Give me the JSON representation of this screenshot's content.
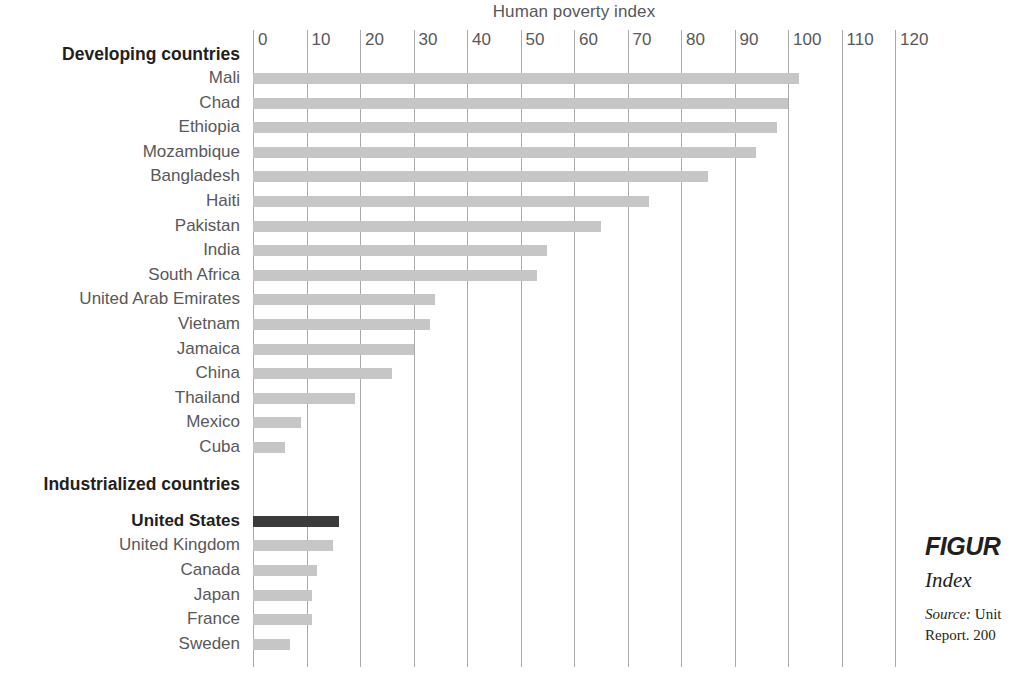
{
  "chart_data": {
    "type": "bar",
    "orientation": "horizontal",
    "title": "Human poverty index",
    "xlabel": "Human poverty index",
    "ylabel": "",
    "xlim": [
      0,
      125
    ],
    "xticks": [
      0,
      10,
      20,
      30,
      40,
      50,
      60,
      70,
      80,
      90,
      100,
      110,
      120
    ],
    "grid": "vertical",
    "legend": "none",
    "groups": [
      {
        "name": "Developing countries",
        "categories": [
          "Mali",
          "Chad",
          "Ethiopia",
          "Mozambique",
          "Bangladesh",
          "Haiti",
          "Pakistan",
          "India",
          "South Africa",
          "United Arab Emirates",
          "Vietnam",
          "Jamaica",
          "China",
          "Thailand",
          "Mexico",
          "Cuba"
        ],
        "values": [
          102,
          100,
          98,
          94,
          85,
          74,
          65,
          55,
          53,
          34,
          33,
          30,
          26,
          19,
          9,
          6
        ]
      },
      {
        "name": "Industrialized countries",
        "categories": [
          "United States",
          "United Kingdom",
          "Canada",
          "Japan",
          "France",
          "Sweden"
        ],
        "values": [
          16,
          15,
          12,
          11,
          11,
          7
        ],
        "highlight": "United States"
      }
    ],
    "colors": {
      "bar": "#c6c6c6",
      "bar_highlight": "#3b3b3b",
      "gridline": "#a7a9ac",
      "text": "#58585a",
      "heading": "#231f20"
    }
  },
  "axis": {
    "title": "Human poverty index",
    "ticks": [
      "0",
      "10",
      "20",
      "30",
      "40",
      "50",
      "60",
      "70",
      "80",
      "90",
      "100",
      "110",
      "120"
    ]
  },
  "groups": {
    "developing": "Developing countries",
    "industrialized": "Industrialized countries"
  },
  "rows": [
    {
      "label": "Mali",
      "value": 102
    },
    {
      "label": "Chad",
      "value": 100
    },
    {
      "label": "Ethiopia",
      "value": 98
    },
    {
      "label": "Mozambique",
      "value": 94
    },
    {
      "label": "Bangladesh",
      "value": 85
    },
    {
      "label": "Haiti",
      "value": 74
    },
    {
      "label": "Pakistan",
      "value": 65
    },
    {
      "label": "India",
      "value": 55
    },
    {
      "label": "South Africa",
      "value": 53
    },
    {
      "label": "United Arab Emirates",
      "value": 34
    },
    {
      "label": "Vietnam",
      "value": 33
    },
    {
      "label": "Jamaica",
      "value": 30
    },
    {
      "label": "China",
      "value": 26
    },
    {
      "label": "Thailand",
      "value": 19
    },
    {
      "label": "Mexico",
      "value": 9
    },
    {
      "label": "Cuba",
      "value": 6
    },
    {
      "label": "United States",
      "value": 16
    },
    {
      "label": "United Kingdom",
      "value": 15
    },
    {
      "label": "Canada",
      "value": 12
    },
    {
      "label": "Japan",
      "value": 11
    },
    {
      "label": "France",
      "value": 11
    },
    {
      "label": "Sweden",
      "value": 7
    }
  ],
  "caption": {
    "figure": "FIGUR",
    "index": "Index",
    "source_label": "Source:",
    "source_text": "Unit",
    "report": "Report. 200"
  }
}
